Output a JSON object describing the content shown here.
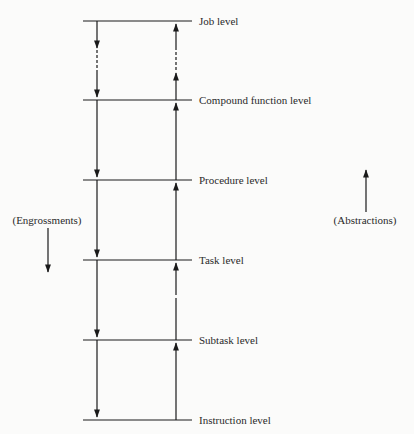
{
  "diagram": {
    "levels": [
      {
        "label": "Job level",
        "y": 21
      },
      {
        "label": "Compound function level",
        "y": 100
      },
      {
        "label": "Procedure level",
        "y": 180
      },
      {
        "label": "Task level",
        "y": 260
      },
      {
        "label": "Subtask level",
        "y": 340
      },
      {
        "label": "Instruction level",
        "y": 420
      }
    ],
    "left_annotation": {
      "label": "(Engrossments)",
      "direction": "down"
    },
    "right_annotation": {
      "label": "(Abstractions)",
      "direction": "up"
    },
    "colors": {
      "line": "#1a1a1a",
      "background": "#fbfbfa"
    }
  }
}
